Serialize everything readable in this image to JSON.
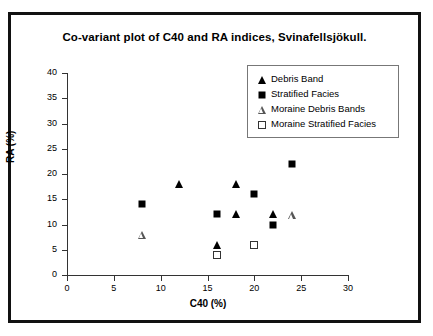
{
  "chart_data": {
    "type": "scatter",
    "title": "Co-variant plot of C40 and RA indices, Svinafellsjökull.",
    "xlabel": "C40 (%)",
    "ylabel": "RA (%)",
    "xlim": [
      0,
      30
    ],
    "ylim": [
      0,
      40
    ],
    "xticks": [
      "0",
      "5",
      "10",
      "15",
      "20",
      "25",
      "30"
    ],
    "yticks": [
      "0",
      "5",
      "10",
      "15",
      "20",
      "25",
      "30",
      "35",
      "40"
    ],
    "grid": false,
    "legend_position": "top-right",
    "series": [
      {
        "name": "Debris Band",
        "marker": "triangle-filled",
        "color": "#000000",
        "points": [
          {
            "x": 12,
            "y": 18
          },
          {
            "x": 16,
            "y": 6
          },
          {
            "x": 18,
            "y": 18
          },
          {
            "x": 18,
            "y": 12
          },
          {
            "x": 22,
            "y": 12
          }
        ]
      },
      {
        "name": "Stratified Facies",
        "marker": "square-filled",
        "color": "#000000",
        "points": [
          {
            "x": 8,
            "y": 14
          },
          {
            "x": 16,
            "y": 12
          },
          {
            "x": 20,
            "y": 16
          },
          {
            "x": 22,
            "y": 10
          },
          {
            "x": 24,
            "y": 22
          }
        ]
      },
      {
        "name": "Moraine Debris Bands",
        "marker": "triangle-open",
        "color": "#555555",
        "points": [
          {
            "x": 8,
            "y": 8
          },
          {
            "x": 24,
            "y": 11.8
          }
        ]
      },
      {
        "name": "Moraine Stratified Facies",
        "marker": "square-open",
        "color": "#333333",
        "points": [
          {
            "x": 16,
            "y": 4
          },
          {
            "x": 20,
            "y": 6
          }
        ]
      }
    ]
  }
}
